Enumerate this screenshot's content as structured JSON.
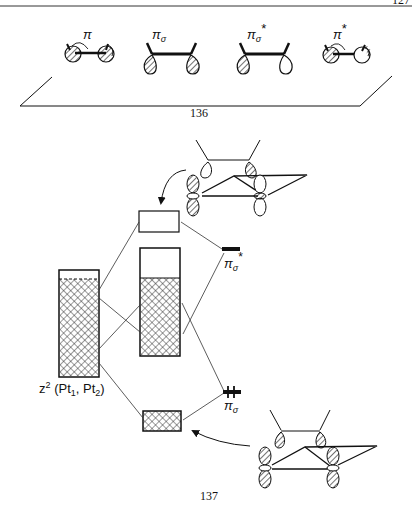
{
  "page": {
    "header_page_number": "127",
    "ink_color": "#111111",
    "background": "#ffffff"
  },
  "figure_136": {
    "number": "136",
    "orbitals": [
      {
        "id": "pi",
        "label": "π",
        "superscript": "",
        "subscript": "",
        "description": "two hatched p-lobes with curved arrows, in-plane pi"
      },
      {
        "id": "pi_sigma",
        "label": "π",
        "superscript": "",
        "subscript": "σ",
        "description": "two hatched lobes below ethylene, both in phase"
      },
      {
        "id": "pi_sigma_star",
        "label": "π",
        "superscript": "*",
        "subscript": "σ",
        "description": "one hatched and one open lobe"
      },
      {
        "id": "pi_star",
        "label": "π",
        "superscript": "*",
        "subscript": "",
        "description": "one hatched, one open lobe with curved arrows"
      }
    ]
  },
  "figure_137": {
    "number": "137",
    "left_block_label": "z² (Pt₁, Pt₂)",
    "left_block_label_parts": {
      "base": "z",
      "sup": "2",
      "open": " (Pt",
      "sub1": "1",
      "comma": ", Pt",
      "sub2": "2",
      "close": ")"
    },
    "levels": [
      {
        "id": "pi_sigma_star",
        "label": "π",
        "subscript": "σ",
        "superscript": "*",
        "occupied": false
      },
      {
        "id": "pi_sigma",
        "label": "π",
        "subscript": "σ",
        "superscript": "",
        "occupied": true
      }
    ]
  }
}
